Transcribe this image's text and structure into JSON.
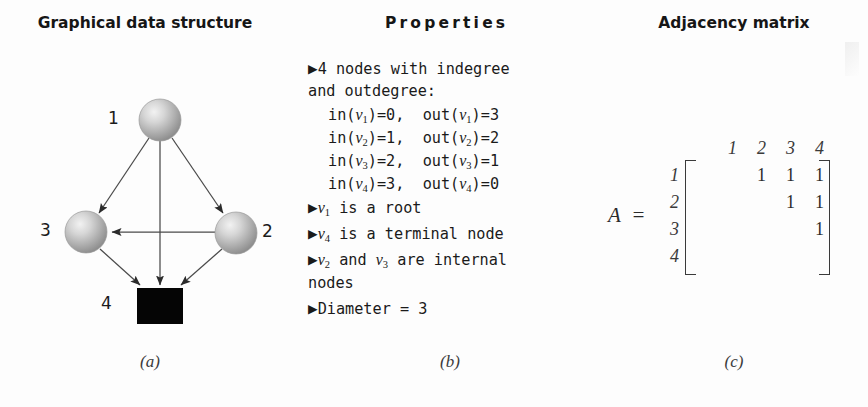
{
  "headings": {
    "panel_a": "Graphical data structure",
    "panel_b": "Properties",
    "panel_c": "Adjacency matrix"
  },
  "captions": {
    "a": "(a)",
    "b": "(b)",
    "c": "(c)"
  },
  "graph": {
    "node_labels": {
      "n1": "1",
      "n2": "2",
      "n3": "3",
      "n4": "4"
    },
    "nodes": [
      {
        "id": "v1",
        "label": "1",
        "shape": "sphere",
        "cx": 160,
        "cy": 120,
        "r": 21
      },
      {
        "id": "v2",
        "label": "2",
        "shape": "sphere",
        "cx": 236,
        "cy": 233,
        "r": 21
      },
      {
        "id": "v3",
        "label": "3",
        "shape": "sphere",
        "cx": 86,
        "cy": 232,
        "r": 21
      },
      {
        "id": "v4",
        "label": "4",
        "shape": "square",
        "x": 137,
        "y": 288,
        "w": 46,
        "h": 36
      }
    ],
    "edges": [
      {
        "from": "v1",
        "to": "v3"
      },
      {
        "from": "v1",
        "to": "v2"
      },
      {
        "from": "v1",
        "to": "v4"
      },
      {
        "from": "v2",
        "to": "v3"
      },
      {
        "from": "v2",
        "to": "v4"
      },
      {
        "from": "v3",
        "to": "v4"
      }
    ],
    "node_fill": "#b8b8b8",
    "node_square_fill": "#000000",
    "edge_color": "#3d3d3d"
  },
  "properties": {
    "bullet_glyph": "▶",
    "line1": "4 nodes with indegree",
    "line2": "and outdegree:",
    "degrees": [
      {
        "in_label": "in(",
        "node": "v",
        "sub": "1",
        "in_value": ")=0,",
        "out_label": "out(",
        "out_sub": "1",
        "out_value": ")=3"
      },
      {
        "in_label": "in(",
        "node": "v",
        "sub": "2",
        "in_value": ")=1,",
        "out_label": "out(",
        "out_sub": "2",
        "out_value": ")=2"
      },
      {
        "in_label": "in(",
        "node": "v",
        "sub": "3",
        "in_value": ")=2,",
        "out_label": "out(",
        "out_sub": "3",
        "out_value": ")=1"
      },
      {
        "in_label": "in(",
        "node": "v",
        "sub": "4",
        "in_value": ")=3,",
        "out_label": "out(",
        "out_sub": "4",
        "out_value": ")=0"
      }
    ],
    "root_text": "is a root",
    "root_node_sub": "1",
    "terminal_text": "is a terminal node",
    "terminal_node_sub": "4",
    "internal_text_mid": "and",
    "internal_text_end": "are internal",
    "internal_node_sub_a": "2",
    "internal_node_sub_b": "3",
    "internal_wrap": "nodes",
    "diameter_text": "Diameter = 3",
    "node_symbol": "v"
  },
  "matrix": {
    "name": "A",
    "equals": "=",
    "col_headers": [
      "1",
      "2",
      "3",
      "4"
    ],
    "row_headers": [
      "1",
      "2",
      "3",
      "4"
    ],
    "rows": [
      [
        "",
        "1",
        "1",
        "1"
      ],
      [
        "",
        "",
        "1",
        "1"
      ],
      [
        "",
        "",
        "",
        "1"
      ],
      [
        "",
        "",
        "",
        ""
      ]
    ]
  }
}
